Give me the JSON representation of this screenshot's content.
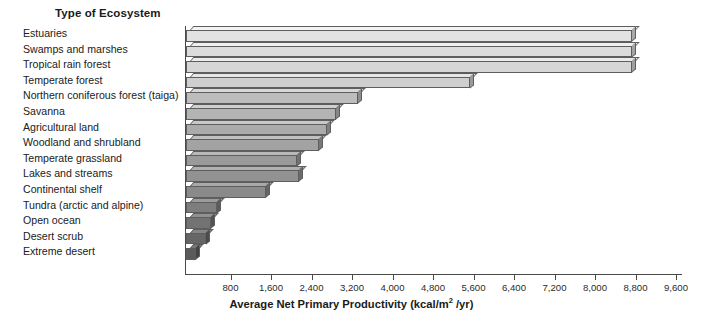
{
  "chart": {
    "type": "bar",
    "orientation": "horizontal",
    "category_axis_title": "Type of Ecosystem",
    "value_axis_title_prefix": "Average Net Primary Productivity (kcal/m",
    "value_axis_title_sup": "2",
    "value_axis_title_suffix": " /yr)"
  },
  "chart_data": {
    "type": "bar",
    "title": "",
    "xlabel": "Average Net Primary Productivity (kcal/m2 /yr)",
    "ylabel": "Type of Ecosystem",
    "orientation": "horizontal",
    "xlim": [
      0,
      9600
    ],
    "grid": false,
    "legend": "none",
    "tick_labels": [
      "800",
      "1,600",
      "2,400",
      "3,200",
      "4,000",
      "4,800",
      "5,600",
      "6,400",
      "7,200",
      "8,000",
      "8,800",
      "9,600"
    ],
    "tick_values": [
      800,
      1600,
      2400,
      3200,
      4000,
      4800,
      5600,
      6400,
      7200,
      8000,
      8800,
      9600
    ],
    "categories": [
      "Estuaries",
      "Swamps and marshes",
      "Tropical rain forest",
      "Temperate forest",
      "Northern coniferous forest (taiga)",
      "Savanna",
      "Agricultural land",
      "Woodland and shrubland",
      "Temperate grassland",
      "Lakes and streams",
      "Continental shelf",
      "Tundra (arctic and alpine)",
      "Open ocean",
      "Desert scrub",
      "Extreme desert"
    ],
    "values": [
      8800,
      8800,
      8800,
      5600,
      3400,
      2970,
      2790,
      2620,
      2190,
      2230,
      1580,
      620,
      500,
      390,
      200
    ],
    "bar_colors": [
      "#e2e2e2",
      "#dcdcdc",
      "#d6d6d6",
      "#cfcfcf",
      "#bdbdbd",
      "#b4b4b4",
      "#ababab",
      "#a3a3a3",
      "#9a9a9a",
      "#929292",
      "#8a8a8a",
      "#7e7e7e",
      "#737373",
      "#666666",
      "#5a5a5a"
    ],
    "bar_top_colors": [
      "#f3f3f3",
      "#efefef",
      "#ebebeb",
      "#e6e6e6",
      "#d8d8d8",
      "#d0d0d0",
      "#c8c8c8",
      "#c0c0c0",
      "#b8b8b8",
      "#b0b0b0",
      "#a8a8a8",
      "#9c9c9c",
      "#919191",
      "#858585",
      "#787878"
    ],
    "bar_side_colors": [
      "#a8a8a8",
      "#a4a4a4",
      "#a0a0a0",
      "#9b9b9b",
      "#8d8d8d",
      "#868686",
      "#7f7f7f",
      "#787878",
      "#717171",
      "#6b6b6b",
      "#656565",
      "#5c5c5c",
      "#545454",
      "#4b4b4b",
      "#434343"
    ]
  }
}
